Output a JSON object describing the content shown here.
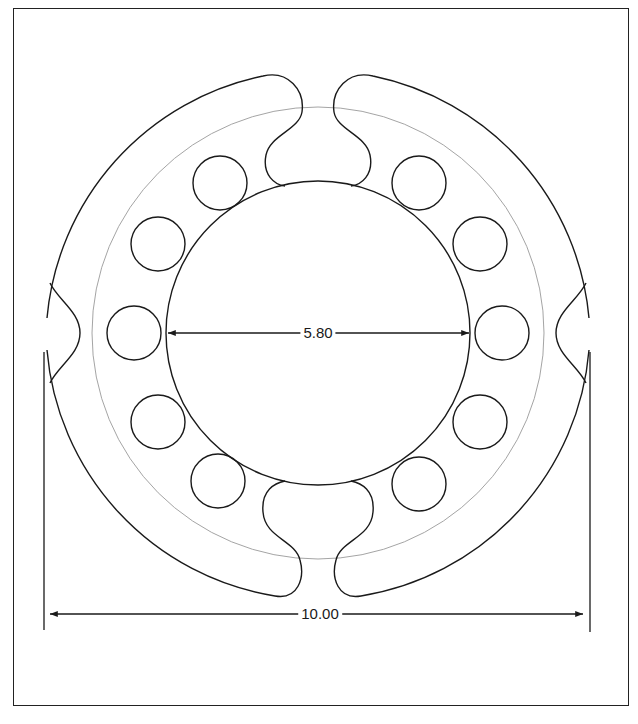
{
  "diagram": {
    "type": "technical-drawing",
    "stroke_color": "#1a1a1a",
    "reference_circle_color": "#9a9a9a",
    "hole_count": 10,
    "segment_count": 4
  },
  "dimensions": {
    "inner_diameter": {
      "label": "5.80"
    },
    "outer_diameter": {
      "label": "10.00"
    }
  }
}
